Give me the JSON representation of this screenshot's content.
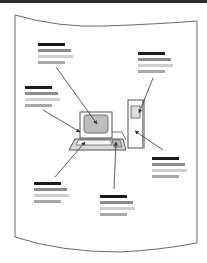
{
  "diagram": {
    "colors": {
      "top_rule": "#2a2a2a",
      "frame": "#6b6b6b",
      "heading_bar": "#1a1a1a",
      "line1_bar": "#8c8c8c",
      "line2_bar": "#cfcfcf",
      "line3_bar": "#a8a8a8",
      "screen_fill": "#bdbdbd",
      "outline": "#555555",
      "arrow": "#333333"
    },
    "callouts": [
      {
        "id": "monitor-screen",
        "x": 38,
        "y": 43,
        "w": [
          27,
          33,
          35,
          27
        ],
        "target": "screen"
      },
      {
        "id": "monitor-frame",
        "x": 25,
        "y": 86,
        "w": [
          27,
          33,
          35,
          27
        ],
        "target": "monitor"
      },
      {
        "id": "drive-bay",
        "x": 138,
        "y": 52,
        "w": [
          27,
          33,
          35,
          27
        ],
        "target": "drive"
      },
      {
        "id": "tower",
        "x": 152,
        "y": 157,
        "w": [
          27,
          33,
          35,
          27
        ],
        "target": "tower"
      },
      {
        "id": "keyboard",
        "x": 34,
        "y": 182,
        "w": [
          27,
          33,
          35,
          27
        ],
        "target": "keyboard"
      },
      {
        "id": "mouse",
        "x": 100,
        "y": 195,
        "w": [
          27,
          33,
          35,
          27
        ],
        "target": "mouse"
      }
    ],
    "components": [
      "monitor",
      "screen",
      "keyboard",
      "mouse",
      "tower",
      "drive-bay"
    ]
  }
}
